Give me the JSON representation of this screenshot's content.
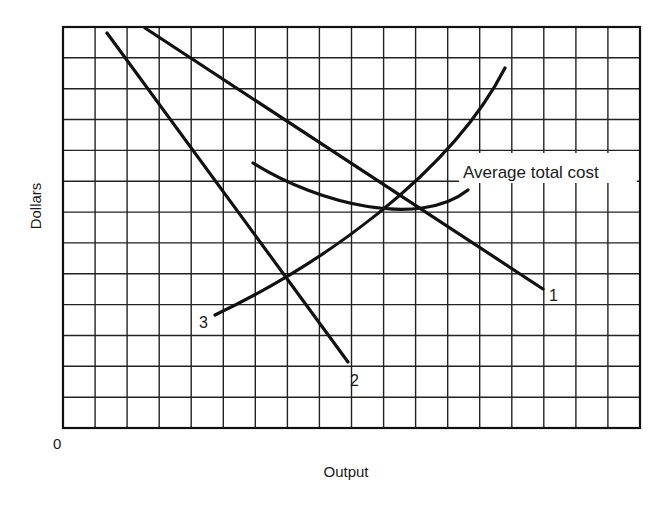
{
  "chart_data": {
    "type": "line",
    "title": "",
    "xlabel": "Output",
    "ylabel": "Dollars",
    "origin_label": "0",
    "grid": true,
    "grid_columns": 18,
    "grid_rows": 13,
    "x_range": [
      0,
      18
    ],
    "y_range": [
      0,
      13
    ],
    "annotation": "Average total cost",
    "series": [
      {
        "name": "1",
        "shape": "straight line, downward sloping",
        "points": [
          [
            2.6,
            13.0
          ],
          [
            15.0,
            4.5
          ]
        ]
      },
      {
        "name": "2",
        "shape": "straight line, steeply downward sloping",
        "points": [
          [
            1.4,
            12.8
          ],
          [
            8.9,
            2.1
          ]
        ]
      },
      {
        "name": "3",
        "shape": "convex upward sloping curve",
        "points": [
          [
            4.7,
            3.6
          ],
          [
            7.0,
            4.9
          ],
          [
            10.0,
            7.0
          ],
          [
            10.6,
            7.5
          ],
          [
            12.0,
            9.5
          ],
          [
            13.8,
            11.7
          ]
        ]
      },
      {
        "name": "Average total cost",
        "shape": "U-shaped curve",
        "points": [
          [
            6.0,
            8.6
          ],
          [
            8.0,
            7.6
          ],
          [
            10.3,
            7.0
          ],
          [
            11.5,
            7.0
          ],
          [
            12.6,
            7.6
          ]
        ]
      }
    ],
    "intersections": [
      {
        "between": [
          "2",
          "3"
        ],
        "point": [
          7.0,
          4.9
        ]
      },
      {
        "between": [
          "3",
          "Average total cost"
        ],
        "point": [
          10.0,
          7.0
        ]
      },
      {
        "between": [
          "1",
          "3"
        ],
        "point": [
          10.6,
          7.5
        ]
      },
      {
        "between": [
          "1",
          "Average total cost"
        ],
        "point": [
          11.3,
          7.0
        ]
      }
    ]
  },
  "labels": {
    "y_axis": "Dollars",
    "x_axis": "Output",
    "origin": "0",
    "curve_1": "1",
    "curve_2": "2",
    "curve_3": "3",
    "atc": "Average total cost"
  },
  "colors": {
    "ink": "#111111",
    "grid": "#222222",
    "background": "#ffffff"
  }
}
